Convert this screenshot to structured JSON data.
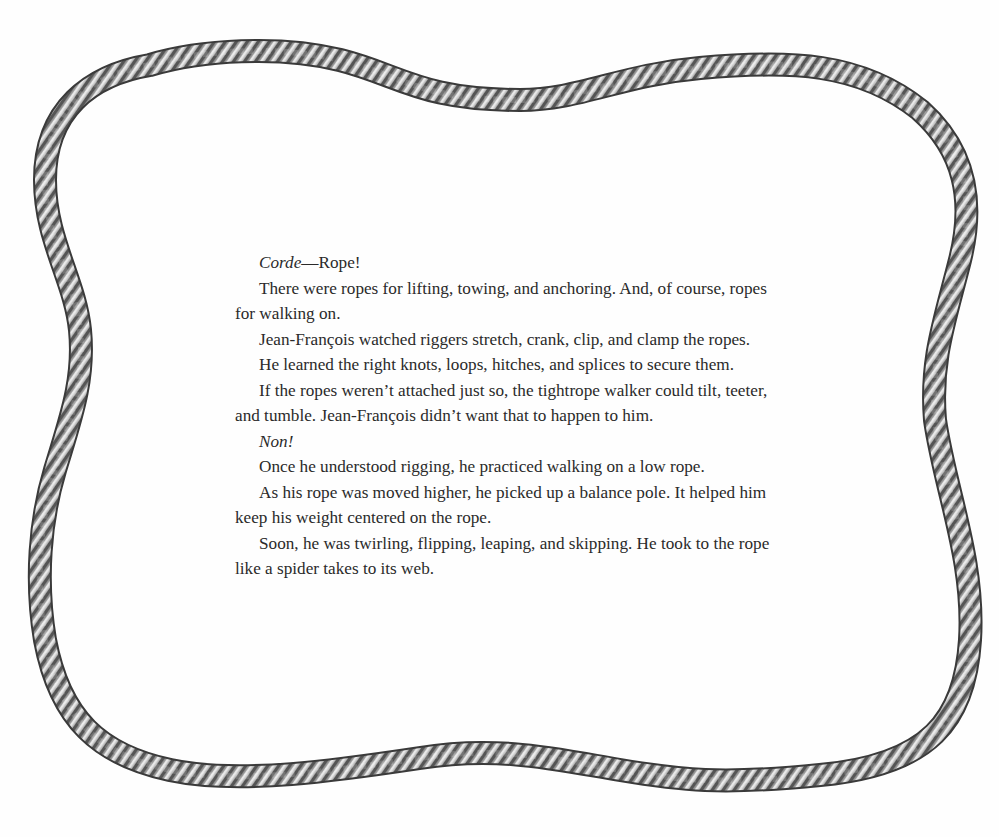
{
  "page": {
    "background": "#fefefe",
    "text_color": "#2a2a2a",
    "rope_colors": {
      "outline": "#3a3a3a",
      "body": "#a8a8a8",
      "highlight": "#e6e6e6",
      "shadow": "#5c5c5c"
    }
  },
  "story": {
    "paragraphs": [
      {
        "italic": "Corde",
        "text": "—Rope!"
      },
      {
        "text": "There were ropes for lifting, towing, and anchoring. And, of course, ropes for walking on."
      },
      {
        "text": "Jean-François watched riggers stretch, crank, clip, and clamp the ropes."
      },
      {
        "text": "He learned the right knots, loops, hitches, and splices to secure them."
      },
      {
        "text": "If the ropes weren’t attached just so, the tightrope walker could tilt, teeter, and tumble. Jean-François didn’t want that to happen to him."
      },
      {
        "italic": "Non!",
        "text": ""
      },
      {
        "text": "Once he understood rigging, he practiced walking on a low rope."
      },
      {
        "text": "As his rope was moved higher, he picked up a balance pole. It helped him keep his weight centered on the rope."
      },
      {
        "text": "Soon, he was twirling, flipping, leaping, and skipping. He took to the rope like a spider takes to its web."
      }
    ]
  },
  "decoration": {
    "frame": "twisted-rope-border"
  }
}
